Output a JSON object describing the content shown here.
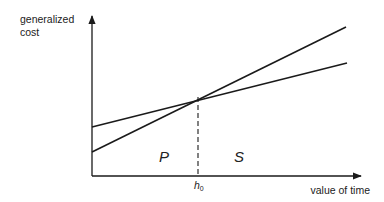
{
  "diagram": {
    "type": "cost-vs-value-of-time",
    "y_axis_label_line1": "generalized",
    "y_axis_label_line2": "cost",
    "x_axis_label": "value of time",
    "threshold_label": "h",
    "threshold_subscript": "0",
    "region_left_label": "P",
    "region_right_label": "S",
    "lines": [
      {
        "name": "steep-cost-line",
        "from": [
          92,
          152
        ],
        "to": [
          346,
          27
        ]
      },
      {
        "name": "flat-cost-line",
        "from": [
          92,
          127
        ],
        "to": [
          347,
          63
        ]
      }
    ],
    "intersection": [
      197,
      97
    ],
    "colors": {
      "line": "#1a1a1a",
      "text": "#222222",
      "background": "#ffffff"
    }
  }
}
